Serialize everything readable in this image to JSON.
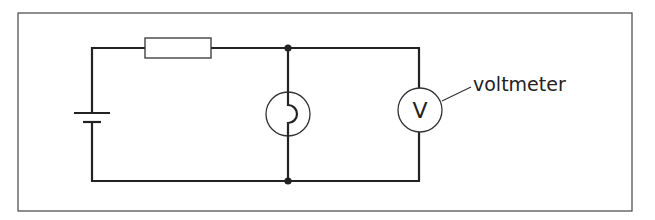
{
  "diagram": {
    "type": "circuit",
    "components": [
      {
        "id": "cell",
        "kind": "battery",
        "position": "left branch"
      },
      {
        "id": "resistor",
        "kind": "resistor",
        "position": "top wire"
      },
      {
        "id": "lamp",
        "kind": "lamp",
        "position": "middle parallel branch"
      },
      {
        "id": "voltmeter",
        "kind": "voltmeter",
        "symbol": "V",
        "position": "right parallel branch"
      }
    ],
    "labels": {
      "voltmeter_label": "voltmeter",
      "voltmeter_symbol": "V"
    },
    "colors": {
      "wire": "#222222",
      "frame": "#444444",
      "background": "#ffffff"
    }
  }
}
